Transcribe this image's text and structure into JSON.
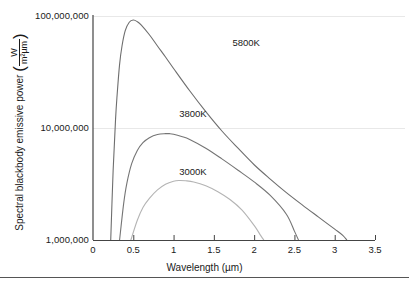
{
  "chart_data": {
    "type": "line",
    "title": "",
    "xlabel": "Wavelength (µm)",
    "ylabel_text": "Spectral blackbody emissive power",
    "ylabel_unit_numerator": "W",
    "ylabel_unit_denominator": "m²µm",
    "xlim": [
      0,
      3.5
    ],
    "ylim": [
      1000000,
      100000000
    ],
    "yscale": "log",
    "grid": true,
    "grid_lines_y": [
      10000000,
      100000000
    ],
    "legend_position": "inline-annotations",
    "xticks": [
      {
        "value": 0,
        "label": "0"
      },
      {
        "value": 0.5,
        "label": "0.5"
      },
      {
        "value": 1,
        "label": "1"
      },
      {
        "value": 1.5,
        "label": "1.5"
      },
      {
        "value": 2,
        "label": "2"
      },
      {
        "value": 2.5,
        "label": "2.5"
      },
      {
        "value": 3,
        "label": "3"
      },
      {
        "value": 3.5,
        "label": "3.5"
      }
    ],
    "yticks": [
      {
        "value": 1000000,
        "label": "1,000,000"
      },
      {
        "value": 10000000,
        "label": "10,000,000"
      },
      {
        "value": 100000000,
        "label": "100,000,000"
      }
    ],
    "series": [
      {
        "name": "5800K",
        "label": "5800K",
        "color": "#6e6e6e",
        "label_x": 1.73,
        "label_y": 57000000,
        "peak_wavelength": 0.5,
        "peak_value": 92000000,
        "x": [
          0.22,
          0.25,
          0.28,
          0.3,
          0.33,
          0.36,
          0.4,
          0.45,
          0.5,
          0.55,
          0.6,
          0.7,
          0.8,
          0.9,
          1.0,
          1.2,
          1.4,
          1.6,
          1.8,
          2.0,
          2.2,
          2.4,
          2.6,
          2.8,
          3.0,
          3.1,
          3.15
        ],
        "y": [
          1000000,
          4200000,
          12000000,
          20000000,
          37000000,
          54000000,
          74000000,
          88000000,
          92000000,
          89000000,
          83000000,
          68000000,
          54000000,
          43000000,
          34000000,
          21500000,
          14000000,
          9400000,
          6600000,
          4700000,
          3500000,
          2650000,
          2050000,
          1600000,
          1250000,
          1100000,
          1000000
        ]
      },
      {
        "name": "3800K",
        "label": "3800K",
        "color": "#757575",
        "label_x": 1.07,
        "label_y": 13300000,
        "peak_wavelength": 0.95,
        "peak_value": 8900000,
        "x": [
          0.33,
          0.38,
          0.42,
          0.48,
          0.55,
          0.62,
          0.7,
          0.8,
          0.9,
          0.95,
          1.0,
          1.1,
          1.2,
          1.4,
          1.6,
          1.8,
          2.0,
          2.2,
          2.4,
          2.5,
          2.55
        ],
        "y": [
          1000000,
          2100000,
          3200000,
          4800000,
          6300000,
          7400000,
          8200000,
          8750000,
          8900000,
          8900000,
          8800000,
          8400000,
          7900000,
          6600000,
          5300000,
          4200000,
          3300000,
          2500000,
          1700000,
          1200000,
          1000000
        ]
      },
      {
        "name": "3000K",
        "label": "3000K",
        "color": "#b4b4b4",
        "label_x": 1.07,
        "label_y": 4050000,
        "peak_wavelength": 1.07,
        "peak_value": 3400000,
        "x": [
          0.47,
          0.55,
          0.62,
          0.7,
          0.8,
          0.9,
          1.0,
          1.07,
          1.15,
          1.25,
          1.4,
          1.55,
          1.7,
          1.85,
          2.0,
          2.08,
          2.12
        ],
        "y": [
          1000000,
          1500000,
          1950000,
          2350000,
          2800000,
          3150000,
          3350000,
          3400000,
          3380000,
          3300000,
          3050000,
          2700000,
          2300000,
          1850000,
          1350000,
          1100000,
          1000000
        ]
      }
    ]
  },
  "axes": {
    "x_title": "Wavelength (µm)",
    "y_title": "Spectral blackbody emissive power",
    "y_unit_num": "W",
    "y_unit_den": "m²µm",
    "paren_open": "(",
    "paren_close": ")"
  },
  "colors": {
    "axis": "#444444",
    "grid": "#e8e8e8",
    "text": "#1a1a1a",
    "rule": "#555555",
    "background": "#ffffff"
  }
}
